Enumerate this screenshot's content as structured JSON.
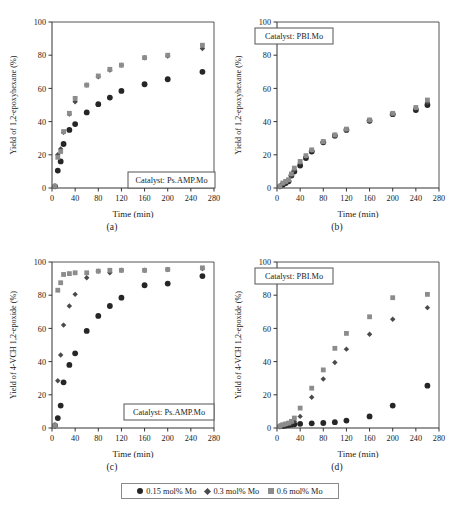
{
  "figure": {
    "legend": {
      "items": [
        {
          "label": "0.15 mol% Mo",
          "marker": "circle-marker",
          "color": "#262626"
        },
        {
          "label": "0.3 mol% Mo",
          "marker": "diamond-marker",
          "color": "#4a4a4a"
        },
        {
          "label": "0.6 mol% Mo",
          "marker": "square-marker",
          "color": "#8c8c8c"
        }
      ]
    },
    "captions": {
      "a": "(a)",
      "b": "(b)",
      "c": "(c)",
      "d": "(d)"
    }
  },
  "chart_data": [
    {
      "panel": "a",
      "type": "scatter",
      "title": "",
      "annotation": "Catalyst: Ps.AMP.Mo",
      "xlabel": "Time (min)",
      "ylabel": "Yield of 1,2-epoxyhexane (%)",
      "xlim": [
        0,
        280
      ],
      "ylim": [
        0,
        100
      ],
      "xticks": [
        0,
        40,
        80,
        120,
        160,
        200,
        240,
        280
      ],
      "yticks": [
        0,
        20,
        40,
        60,
        80,
        100
      ],
      "grid": false,
      "legend_position": "figure-bottom",
      "series": [
        {
          "name": "0.15 mol% Mo",
          "marker": "circle",
          "color": "#262626",
          "x": [
            5,
            10,
            15,
            20,
            30,
            40,
            60,
            80,
            100,
            120,
            160,
            200,
            260
          ],
          "y": [
            1,
            10.5,
            16,
            26.5,
            35,
            38.5,
            45.5,
            50.5,
            54.5,
            58.5,
            62.5,
            65.5,
            70
          ]
        },
        {
          "name": "0.3 mol% Mo",
          "marker": "diamond",
          "color": "#4a4a4a",
          "x": [
            5,
            10,
            15,
            20,
            30,
            40,
            60,
            80,
            100,
            120,
            160,
            200,
            260
          ],
          "y": [
            1,
            20,
            23.5,
            33.5,
            44.5,
            52,
            62,
            67,
            71,
            74,
            78.5,
            79.5,
            84
          ]
        },
        {
          "name": "0.6 mol% Mo",
          "marker": "square",
          "color": "#8c8c8c",
          "x": [
            5,
            10,
            15,
            20,
            30,
            40,
            60,
            80,
            100,
            120,
            160,
            200,
            260
          ],
          "y": [
            1,
            18.5,
            22,
            34,
            45,
            54,
            62,
            67.5,
            71.5,
            74,
            78.5,
            80,
            86
          ]
        }
      ]
    },
    {
      "panel": "b",
      "type": "scatter",
      "title": "",
      "annotation": "Catalyst: PBI.Mo",
      "xlabel": "Time (min)",
      "ylabel": "Yield of 1,2-epoxyhexane (%)",
      "xlim": [
        0,
        280
      ],
      "ylim": [
        0,
        100
      ],
      "xticks": [
        0,
        40,
        80,
        120,
        160,
        200,
        240,
        280
      ],
      "yticks": [
        0,
        20,
        40,
        60,
        80,
        100
      ],
      "grid": false,
      "legend_position": "figure-bottom",
      "series": [
        {
          "name": "0.15 mol% Mo",
          "marker": "circle",
          "color": "#262626",
          "x": [
            5,
            10,
            15,
            20,
            25,
            30,
            40,
            50,
            60,
            80,
            100,
            120,
            160,
            200,
            240,
            260
          ],
          "y": [
            1,
            2,
            3,
            4,
            7.5,
            10,
            13.5,
            18,
            22,
            27.5,
            31.5,
            35,
            40.5,
            44.5,
            47,
            50
          ]
        },
        {
          "name": "0.3 mol% Mo",
          "marker": "diamond",
          "color": "#4a4a4a",
          "x": [
            5,
            10,
            15,
            20,
            25,
            30,
            40,
            50,
            60,
            80,
            100,
            120,
            160,
            200,
            240,
            260
          ],
          "y": [
            1,
            2.5,
            3.5,
            4.5,
            8,
            11,
            15,
            19,
            22.5,
            27.5,
            31.5,
            35,
            40.5,
            44.5,
            48,
            51.5
          ]
        },
        {
          "name": "0.6 mol% Mo",
          "marker": "square",
          "color": "#8c8c8c",
          "x": [
            5,
            10,
            15,
            20,
            25,
            30,
            40,
            50,
            60,
            80,
            100,
            120,
            160,
            200,
            240,
            260
          ],
          "y": [
            1,
            3,
            4,
            5,
            8.5,
            12,
            16,
            19.5,
            23,
            28,
            32,
            35.5,
            41,
            45,
            48.5,
            53
          ]
        }
      ]
    },
    {
      "panel": "c",
      "type": "scatter",
      "title": "",
      "annotation": "Catalyst: Ps.AMP.Mo",
      "xlabel": "Time (min)",
      "ylabel": "Yield of 4-VCH 1,2-epoxide (%)",
      "xlim": [
        0,
        280
      ],
      "ylim": [
        0,
        100
      ],
      "xticks": [
        0,
        40,
        80,
        120,
        160,
        200,
        240,
        280
      ],
      "yticks": [
        0,
        20,
        40,
        60,
        80,
        100
      ],
      "grid": false,
      "legend_position": "figure-bottom",
      "series": [
        {
          "name": "0.15 mol% Mo",
          "marker": "circle",
          "color": "#262626",
          "x": [
            5,
            10,
            15,
            20,
            30,
            40,
            60,
            80,
            100,
            120,
            160,
            200,
            260
          ],
          "y": [
            1.5,
            6,
            13.5,
            27.5,
            38,
            45,
            58.5,
            67.5,
            73.5,
            78.5,
            86,
            87,
            91.5
          ]
        },
        {
          "name": "0.3 mol% Mo",
          "marker": "diamond",
          "color": "#4a4a4a",
          "x": [
            5,
            10,
            15,
            20,
            30,
            40,
            60,
            80,
            100,
            120,
            160,
            200,
            260
          ],
          "y": [
            1.5,
            28.5,
            44,
            62,
            73.5,
            80.5,
            90.5,
            94.5,
            93.5,
            95,
            95,
            95.5,
            96
          ]
        },
        {
          "name": "0.6 mol% Mo",
          "marker": "square",
          "color": "#8c8c8c",
          "x": [
            5,
            10,
            15,
            20,
            30,
            40,
            60,
            80,
            100,
            120,
            160,
            200,
            260
          ],
          "y": [
            1.5,
            83,
            87.5,
            92.5,
            93,
            93.5,
            93.5,
            94.5,
            95,
            95,
            95,
            95.5,
            96.5
          ]
        }
      ]
    },
    {
      "panel": "d",
      "type": "scatter",
      "title": "",
      "annotation": "Catalyst: PBI.Mo",
      "xlabel": "Time (min)",
      "ylabel": "Yield of 4-VCH 1,2-epoxide (%)",
      "xlim": [
        0,
        280
      ],
      "ylim": [
        0,
        100
      ],
      "xticks": [
        0,
        40,
        80,
        120,
        160,
        200,
        240,
        280
      ],
      "yticks": [
        0,
        20,
        40,
        60,
        80,
        100
      ],
      "grid": false,
      "legend_position": "figure-bottom",
      "series": [
        {
          "name": "0.15 mol% Mo",
          "marker": "circle",
          "color": "#262626",
          "x": [
            5,
            10,
            15,
            20,
            25,
            30,
            40,
            60,
            80,
            100,
            120,
            160,
            200,
            260
          ],
          "y": [
            1,
            1.2,
            1.5,
            1.8,
            2,
            2.2,
            2.5,
            2.8,
            3,
            3.5,
            4.5,
            7,
            13.5,
            25.5
          ]
        },
        {
          "name": "0.3 mol% Mo",
          "marker": "diamond",
          "color": "#4a4a4a",
          "x": [
            5,
            10,
            15,
            20,
            25,
            30,
            40,
            60,
            80,
            100,
            120,
            160,
            200,
            260
          ],
          "y": [
            1,
            1.5,
            2,
            2.5,
            3,
            4,
            7,
            18.5,
            29.5,
            39.5,
            47.5,
            56.5,
            65.5,
            72.5
          ]
        },
        {
          "name": "0.6 mol% Mo",
          "marker": "square",
          "color": "#8c8c8c",
          "x": [
            5,
            10,
            15,
            20,
            25,
            30,
            40,
            60,
            80,
            100,
            120,
            160,
            200,
            260
          ],
          "y": [
            1,
            2,
            2.5,
            3,
            4,
            6,
            12,
            24,
            35,
            48,
            57,
            67,
            78.5,
            80.5
          ]
        }
      ]
    }
  ]
}
